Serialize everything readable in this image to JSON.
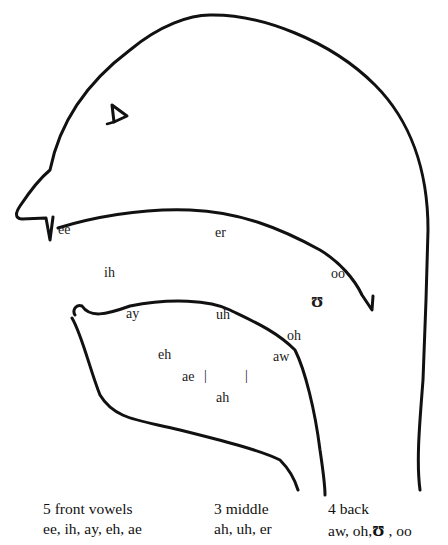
{
  "diagram": {
    "type": "vocal-tract-vowel-map",
    "mouth_labels": [
      {
        "id": "ee",
        "text": "ee",
        "x": 58,
        "y": 228
      },
      {
        "id": "er",
        "text": "er",
        "x": 215,
        "y": 230
      },
      {
        "id": "ih",
        "text": "ih",
        "x": 104,
        "y": 270
      },
      {
        "id": "oo",
        "text": "oo",
        "x": 331,
        "y": 272
      },
      {
        "id": "upsilon",
        "text": "ʊ",
        "x": 311,
        "y": 294
      },
      {
        "id": "ay",
        "text": "ay",
        "x": 126,
        "y": 312
      },
      {
        "id": "uh",
        "text": "uh",
        "x": 216,
        "y": 312
      },
      {
        "id": "oh",
        "text": "oh",
        "x": 287,
        "y": 333
      },
      {
        "id": "eh",
        "text": "eh",
        "x": 158,
        "y": 351
      },
      {
        "id": "aw",
        "text": "aw",
        "x": 273,
        "y": 353
      },
      {
        "id": "ae",
        "text": "ae",
        "x": 182,
        "y": 373
      },
      {
        "id": "ah",
        "text": "ah",
        "x": 216,
        "y": 394
      }
    ],
    "markers": [
      {
        "id": "tick-left",
        "text": "|",
        "x": 204,
        "y": 372
      },
      {
        "id": "tick-right",
        "text": "|",
        "x": 245,
        "y": 372
      }
    ]
  },
  "legend": {
    "front": {
      "heading": "5 front vowels",
      "list": "ee, ih, ay, eh, ae"
    },
    "middle": {
      "heading": "3 middle",
      "list": "ah, uh, er"
    },
    "back": {
      "heading": "4 back",
      "list_a": "aw, oh,",
      "list_symbol": "ʊ",
      "list_b": " , oo"
    }
  },
  "colors": {
    "stroke": "#111111",
    "background": "#ffffff"
  }
}
